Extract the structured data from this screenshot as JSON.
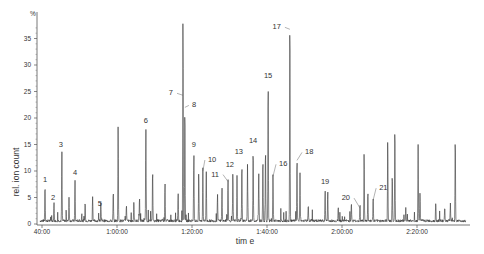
{
  "chart_data": {
    "type": "line",
    "title": "",
    "xlabel": "tim e",
    "ylabel": "rel. ion count",
    "y_unit_label": "%",
    "ylim": [
      0,
      39
    ],
    "xlim_minutes": [
      39.5,
      156
    ],
    "grid": false,
    "legend": null,
    "x_ticks": [
      {
        "label": "40:00",
        "minutes": 40
      },
      {
        "label": "1:00:00",
        "minutes": 60
      },
      {
        "label": "1:20:00",
        "minutes": 80
      },
      {
        "label": "1:40:00",
        "minutes": 100
      },
      {
        "label": "2:00:00",
        "minutes": 120
      },
      {
        "label": "2:20:00",
        "minutes": 140
      }
    ],
    "y_ticks": [
      0,
      5,
      10,
      15,
      20,
      25,
      30,
      35
    ],
    "series": [
      {
        "name": "chromatogram",
        "color": "#333333",
        "labeled_peaks": [
          {
            "label": "1",
            "minutes": 40.8,
            "value": 6.8
          },
          {
            "label": "2",
            "minutes": 43.2,
            "value": 3.4
          },
          {
            "label": "3",
            "minutes": 45.3,
            "value": 13.0
          },
          {
            "label": "4",
            "minutes": 48.8,
            "value": 7.7
          },
          {
            "label": "5",
            "minutes": 55.7,
            "value": 2.5
          },
          {
            "label": "6",
            "minutes": 67.7,
            "value": 17.7
          },
          {
            "label": "7",
            "minutes": 77.6,
            "value": 39.0
          },
          {
            "label": "8",
            "minutes": 78.1,
            "value": 22.0
          },
          {
            "label": "9",
            "minutes": 80.5,
            "value": 13.0
          },
          {
            "label": "10",
            "minutes": 82.9,
            "value": 10.0
          },
          {
            "label": "11",
            "minutes": 89.6,
            "value": 8.0
          },
          {
            "label": "12",
            "minutes": 90.9,
            "value": 9.0
          },
          {
            "label": "13",
            "minutes": 93.3,
            "value": 11.0
          },
          {
            "label": "14",
            "minutes": 96.3,
            "value": 13.8
          },
          {
            "label": "15",
            "minutes": 100.3,
            "value": 26.0
          },
          {
            "label": "16",
            "minutes": 101.6,
            "value": 9.0
          },
          {
            "label": "17",
            "minutes": 106.1,
            "value": 39.0
          },
          {
            "label": "18",
            "minutes": 108.0,
            "value": 12.0
          },
          {
            "label": "19",
            "minutes": 115.5,
            "value": 5.8
          },
          {
            "label": "20",
            "minutes": 124.8,
            "value": 3.0
          },
          {
            "label": "21",
            "minutes": 128.3,
            "value": 4.5
          }
        ],
        "unlabeled_peaks": [
          {
            "minutes": 47.2,
            "value": 4.5
          },
          {
            "minutes": 51.5,
            "value": 3.5
          },
          {
            "minutes": 53.5,
            "value": 4.8
          },
          {
            "minutes": 59.0,
            "value": 5.5
          },
          {
            "minutes": 60.3,
            "value": 18.2
          },
          {
            "minutes": 62.5,
            "value": 3.0
          },
          {
            "minutes": 64.5,
            "value": 3.5
          },
          {
            "minutes": 66.0,
            "value": 4.5
          },
          {
            "minutes": 69.5,
            "value": 9.5
          },
          {
            "minutes": 72.8,
            "value": 7.5
          },
          {
            "minutes": 76.3,
            "value": 5.5
          },
          {
            "minutes": 81.8,
            "value": 9.0
          },
          {
            "minutes": 83.8,
            "value": 9.2
          },
          {
            "minutes": 86.8,
            "value": 5.0
          },
          {
            "minutes": 88.0,
            "value": 6.0
          },
          {
            "minutes": 92.0,
            "value": 8.5
          },
          {
            "minutes": 94.8,
            "value": 10.5
          },
          {
            "minutes": 97.8,
            "value": 9.0
          },
          {
            "minutes": 98.9,
            "value": 12.0
          },
          {
            "minutes": 99.6,
            "value": 14.0
          },
          {
            "minutes": 108.8,
            "value": 9.0
          },
          {
            "minutes": 111.0,
            "value": 3.0
          },
          {
            "minutes": 116.2,
            "value": 5.5
          },
          {
            "minutes": 119.0,
            "value": 2.5
          },
          {
            "minutes": 122.5,
            "value": 3.5
          },
          {
            "minutes": 125.9,
            "value": 13.0
          },
          {
            "minutes": 126.9,
            "value": 5.5
          },
          {
            "minutes": 132.2,
            "value": 15.5
          },
          {
            "minutes": 133.4,
            "value": 9.0
          },
          {
            "minutes": 134.1,
            "value": 18.0
          },
          {
            "minutes": 137.0,
            "value": 2.5
          },
          {
            "minutes": 140.3,
            "value": 14.5
          },
          {
            "minutes": 140.8,
            "value": 5.5
          },
          {
            "minutes": 145.0,
            "value": 3.5
          },
          {
            "minutes": 147.4,
            "value": 2.5
          },
          {
            "minutes": 148.9,
            "value": 3.2
          },
          {
            "minutes": 150.2,
            "value": 16.0
          }
        ]
      }
    ]
  },
  "axes": {
    "y_unit": "%",
    "y_title": "rel. ion count",
    "x_title": "tim e",
    "y_tick_labels": [
      "0",
      "5",
      "10",
      "15",
      "20",
      "25",
      "30",
      "35"
    ],
    "x_tick_labels": [
      "40:00",
      "1:00:00",
      "1:20:00",
      "1:40:00",
      "2:00:00",
      "2:20:00"
    ]
  }
}
